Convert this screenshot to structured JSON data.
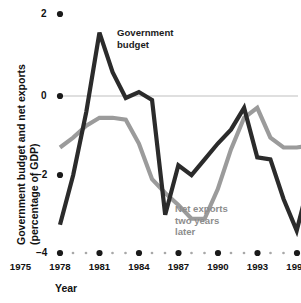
{
  "chart_data": {
    "type": "line",
    "title": "",
    "xlabel": "Year",
    "ylabel": "Government budget and net exports\n(percentage of GDP)",
    "ylabel_line1": "Government budget and net exports",
    "ylabel_line2": "(percentage of GDP)",
    "xlim": [
      1974,
      1996.5
    ],
    "ylim": [
      -4,
      2
    ],
    "yticks": [
      2,
      0,
      -2,
      -4
    ],
    "ytick_labels": [
      "2",
      "0",
      "−2",
      "−4"
    ],
    "xticks": [
      1975,
      1978,
      1981,
      1984,
      1987,
      1990,
      1993,
      1996
    ],
    "xtick_labels": [
      "1975",
      "1978",
      "1981",
      "1984",
      "1987",
      "1990",
      "1993",
      "1996"
    ],
    "x": [
      1975,
      1976,
      1977,
      1978,
      1979,
      1980,
      1981,
      1982,
      1983,
      1984,
      1985,
      1986,
      1987,
      1988,
      1989,
      1990,
      1991,
      1992,
      1993,
      1994,
      1995,
      1996
    ],
    "grid": false,
    "zero_line": true,
    "legend_position": "inline-annotations",
    "series": [
      {
        "name": "Government budget",
        "color": "#2b2b2b",
        "label_text": "Government\nbudget",
        "values": [
          -3.25,
          -2.0,
          -0.4,
          1.6,
          0.6,
          -0.05,
          0.1,
          -0.1,
          -3.0,
          -1.75,
          -2.0,
          -1.6,
          -1.2,
          -0.85,
          -0.3,
          -1.55,
          -1.6,
          -2.6,
          -3.4,
          -2.1,
          -1.0,
          -1.0
        ]
      },
      {
        "name": "Net exports two years later",
        "color": "#9b9b9b",
        "label_text": "Net exports\ntwo years\nlater",
        "values": [
          -1.3,
          -1.05,
          -0.75,
          -0.55,
          -0.55,
          -0.6,
          -1.2,
          -2.1,
          -2.45,
          -2.75,
          -3.1,
          -3.1,
          -2.35,
          -1.35,
          -0.55,
          -0.3,
          -1.05,
          -1.3,
          -1.3,
          -1.25,
          -1.0,
          -1.0
        ]
      }
    ]
  },
  "axis": {
    "y_tick_2": "2",
    "y_tick_0": "0",
    "y_tick_m2": "−2",
    "y_tick_m4": "−4",
    "y_title_line1": "Government budget and net exports",
    "y_title_line2": "(percentage of GDP)",
    "x_title": "Year"
  },
  "annotations": {
    "government_budget": "Government\nbudget",
    "net_exports": "Net exports\ntwo years\nlater"
  }
}
